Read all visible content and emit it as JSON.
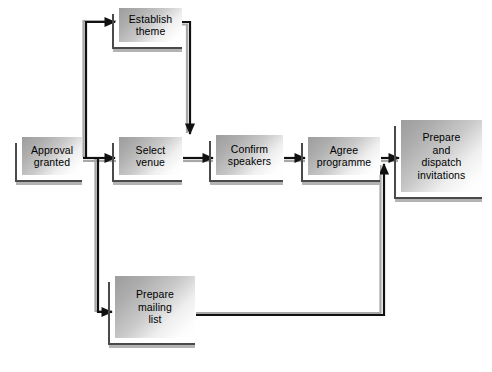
{
  "diagram": {
    "nodes": [
      {
        "id": "approval",
        "label": "Approval\ngranted",
        "x": 22,
        "y": 137,
        "w": 60,
        "h": 38
      },
      {
        "id": "establish",
        "label": "Establish\ntheme",
        "x": 119,
        "y": 8,
        "w": 63,
        "h": 34
      },
      {
        "id": "select",
        "label": "Select\nvenue",
        "x": 119,
        "y": 137,
        "w": 63,
        "h": 38
      },
      {
        "id": "confirm",
        "label": "Confirm\nspeakers",
        "x": 216,
        "y": 135,
        "w": 67,
        "h": 40
      },
      {
        "id": "agree",
        "label": "Agree\nprogramme",
        "x": 308,
        "y": 137,
        "w": 72,
        "h": 38
      },
      {
        "id": "prepdisp",
        "label": "Prepare\nand\ndispatch\ninvitations",
        "x": 401,
        "y": 120,
        "w": 81,
        "h": 72
      },
      {
        "id": "mailing",
        "label": "Prepare\nmailing\nlist",
        "x": 115,
        "y": 276,
        "w": 80,
        "h": 62
      }
    ],
    "edges": [
      {
        "from": "approval",
        "to": "select",
        "label": ""
      },
      {
        "from": "approval",
        "to": "establish",
        "label": ""
      },
      {
        "from": "establish",
        "to": "select",
        "label": ""
      },
      {
        "from": "approval",
        "to": "mailing",
        "label": ""
      },
      {
        "from": "select",
        "to": "confirm",
        "label": ""
      },
      {
        "from": "confirm",
        "to": "agree",
        "label": ""
      },
      {
        "from": "agree",
        "to": "prepdisp",
        "label": ""
      },
      {
        "from": "mailing",
        "to": "prepdisp",
        "label": ""
      }
    ],
    "colors": {
      "line": "#111111",
      "line_shadow": "#a8a8a8",
      "box_frame": "#4a4a4a",
      "box_fill_dark": "#9d9d9d",
      "box_fill_light": "#ffffff",
      "text": "#000000",
      "background": "#ffffff"
    }
  }
}
